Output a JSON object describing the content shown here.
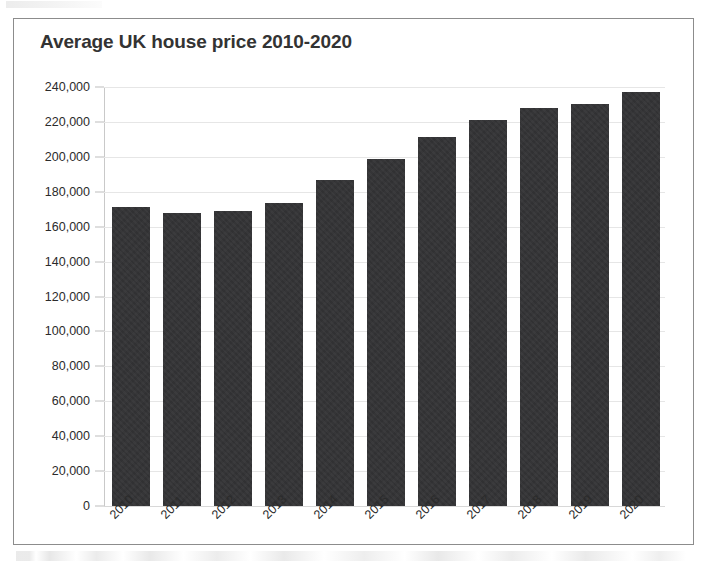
{
  "chart_data": {
    "type": "bar",
    "title": "Average UK house price 2010-2020",
    "xlabel": "",
    "ylabel": "",
    "categories": [
      "2010",
      "2011",
      "2012",
      "2013",
      "2014",
      "2015",
      "2016",
      "2017",
      "2018",
      "2019",
      "2020"
    ],
    "values": [
      171000,
      168000,
      169000,
      173500,
      186500,
      198500,
      211500,
      221000,
      228000,
      230500,
      237000
    ],
    "ylim": [
      0,
      240000
    ],
    "ytick_step": 20000,
    "ytick_labels": [
      "240,000",
      "220,000",
      "200,000",
      "180,000",
      "160,000",
      "140,000",
      "120,000",
      "100,000",
      "80,000",
      "60,000",
      "40,000",
      "20,000",
      "0"
    ],
    "ytick_values": [
      240000,
      220000,
      200000,
      180000,
      160000,
      140000,
      120000,
      100000,
      80000,
      60000,
      40000,
      20000,
      0
    ],
    "grid": true,
    "legend": false,
    "legend_position": "none",
    "bar_color": "#333335",
    "gridline_color": "#e6e6e6",
    "axis_color": "#c9c9c9",
    "title_color": "#333333",
    "tick_label_color": "#2b2b2b",
    "xlabel_rotation_deg": -45,
    "frame_border_color": "#8c8c8c",
    "background_color": "#ffffff"
  }
}
